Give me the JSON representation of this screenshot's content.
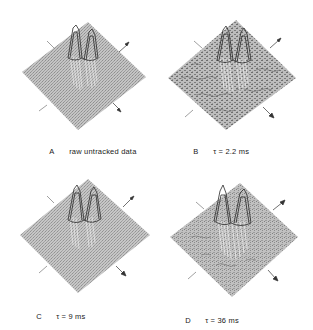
{
  "figure": {
    "panels": [
      {
        "id": "A",
        "letter": "A",
        "caption": "raw untracked data",
        "noise": "low"
      },
      {
        "id": "B",
        "letter": "B",
        "caption": "τ = 2.2 ms",
        "noise": "high"
      },
      {
        "id": "C",
        "letter": "C",
        "caption": "τ = 9 ms",
        "noise": "low"
      },
      {
        "id": "D",
        "letter": "D",
        "caption": "τ = 36 ms",
        "noise": "medium"
      }
    ],
    "colors": {
      "surface": "#b8b8b8",
      "surface_dark": "#8a8a8a",
      "peaks": "#2a2a2a",
      "ink": "#1a1a1a"
    }
  }
}
